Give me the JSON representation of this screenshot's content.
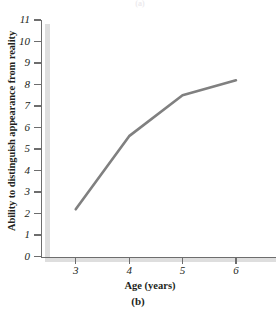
{
  "figure": {
    "panel_label": "(b)",
    "top_clipped_label": "(a)",
    "line_color": "#808080",
    "axis_color": "#6d6d6d",
    "shadow_color": "#dedede",
    "text_color": "#231f20"
  },
  "chart_data": {
    "type": "line",
    "title": "",
    "xlabel": "Age (years)",
    "ylabel": "Ability to distinguish appearance from reality",
    "x": [
      3,
      4,
      5,
      6
    ],
    "values": [
      2.2,
      5.6,
      7.5,
      8.2
    ],
    "series": [
      {
        "name": "Ability to distinguish appearance from reality",
        "values": [
          2.2,
          5.6,
          7.5,
          8.2
        ]
      }
    ],
    "xticks": [
      3,
      4,
      5,
      6
    ],
    "xticklabels": [
      "3",
      "4",
      "5",
      "6"
    ],
    "yticks": [
      0,
      1,
      2,
      3,
      4,
      5,
      6,
      7,
      8,
      9,
      10,
      11
    ],
    "yticklabels": [
      "0",
      "1",
      "2",
      "3",
      "4",
      "5",
      "6",
      "7",
      "8",
      "9",
      "10",
      "11"
    ],
    "xlim": [
      2.35,
      6.75
    ],
    "ylim": [
      0,
      11
    ],
    "grid": false,
    "legend": false,
    "markers": false
  }
}
